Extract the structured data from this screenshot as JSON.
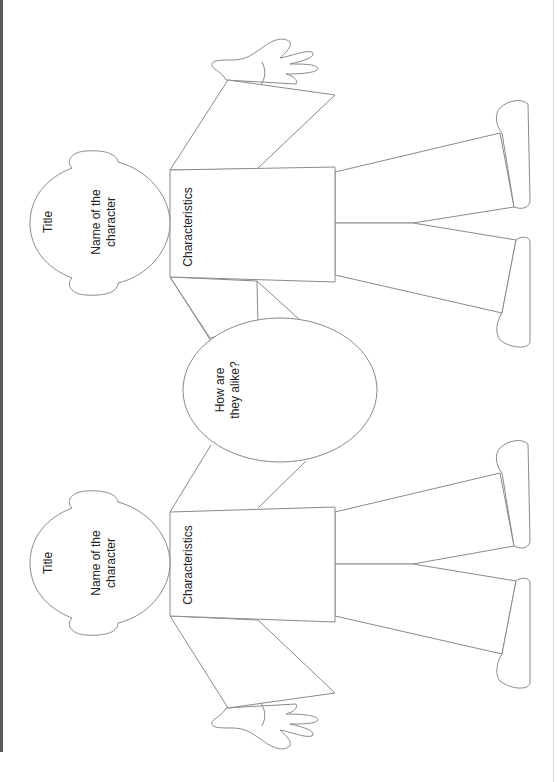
{
  "diagram": {
    "type": "character-comparison-organizer",
    "stroke_color": "#8a8a8a",
    "text_color": "#222222",
    "characters": [
      {
        "position": "top",
        "title_label": "Title",
        "name_label_line1": "Name of the",
        "name_label_line2": "character",
        "characteristics_label": "Characteristics"
      },
      {
        "position": "bottom",
        "title_label": "Title",
        "name_label_line1": "Name of the",
        "name_label_line2": "character",
        "characteristics_label": "Characteristics"
      }
    ],
    "center": {
      "label_line1": "How are",
      "label_line2": "they alike?"
    }
  }
}
